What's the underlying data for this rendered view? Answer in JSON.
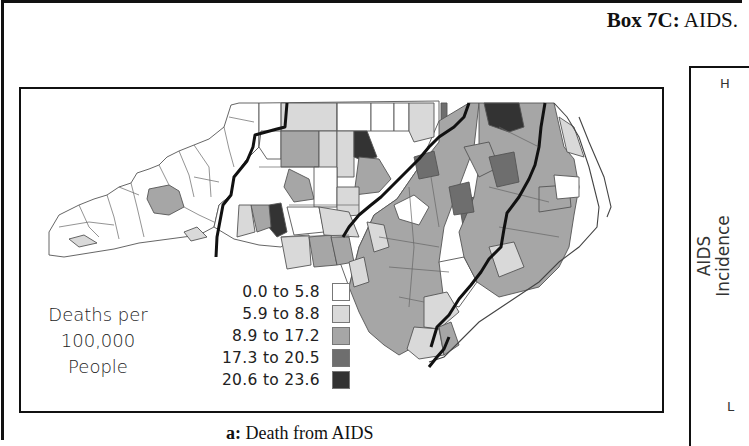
{
  "box": {
    "label_bold": "Box 7C:",
    "label_rest": " AIDS."
  },
  "map": {
    "title": "Death from AIDS",
    "caption_prefix": "a:",
    "caption_text": " Death from AIDS",
    "region": "North Carolina counties",
    "legend": {
      "title_lines": [
        "Deaths per",
        "100,000",
        "People"
      ],
      "classes": [
        {
          "label": "0.0 to 5.8",
          "color": "#ffffff"
        },
        {
          "label": "5.9 to 8.8",
          "color": "#d9d9d9"
        },
        {
          "label": "8.9 to 17.2",
          "color": "#a6a6a6"
        },
        {
          "label": "17.3 to 20.5",
          "color": "#6e6e6e"
        },
        {
          "label": "20.6 to 23.6",
          "color": "#333333"
        }
      ]
    },
    "region_boundaries": 4
  },
  "side_panel": {
    "axis_label_lines": [
      "AIDS",
      "Incidence"
    ],
    "high_label": "H",
    "low_label": "L"
  }
}
